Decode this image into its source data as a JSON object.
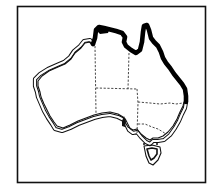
{
  "map": {
    "subject": "Australia outline map",
    "frame": {
      "x": 17,
      "y": 6,
      "width": 188,
      "height": 177,
      "stroke": "#111111"
    },
    "colors": {
      "background": "#ffffff",
      "coast_thick": "#000000",
      "coast_outline": "#111111",
      "state_borders": "#333333"
    },
    "legend": [],
    "labels": []
  }
}
